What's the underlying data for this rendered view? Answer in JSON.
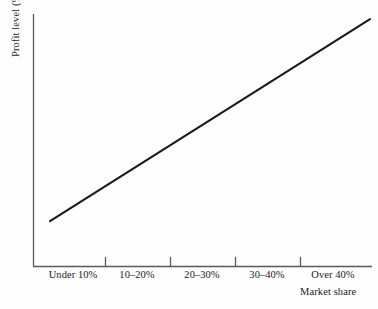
{
  "figure": {
    "background_color": "#fefefe",
    "axis_color": "#5a5a5a",
    "line_color": "#1a1a1a",
    "text_color": "#1d1d1d"
  },
  "chart_data": {
    "type": "line",
    "title": "",
    "xlabel": "Market share",
    "ylabel": "Profit level (%)",
    "categories": [
      "Under 10%",
      "10–20%",
      "20–30%",
      "30–40%",
      "Over 40%"
    ],
    "series": [
      {
        "name": "Profit level",
        "values": [
          18,
          38,
          58,
          78,
          98
        ]
      }
    ],
    "xlim": [
      0,
      5
    ],
    "ylim": [
      0,
      100
    ],
    "grid": false,
    "legend": false,
    "axis_ticks_x": 4,
    "axis_tick_values_shown": false,
    "annotation": "Profit level rises steadily and linearly as market share increases"
  },
  "axes": {
    "y_title": "Profit level (%)",
    "x_title": "Market share"
  },
  "x_tick_labels": [
    {
      "label": "Under 10%",
      "center_px": 40
    },
    {
      "label": "10–20%",
      "center_px": 104
    },
    {
      "label": "20–30%",
      "center_px": 169
    },
    {
      "label": "30–40%",
      "center_px": 234
    },
    {
      "label": "Over 40%",
      "center_px": 300
    }
  ]
}
